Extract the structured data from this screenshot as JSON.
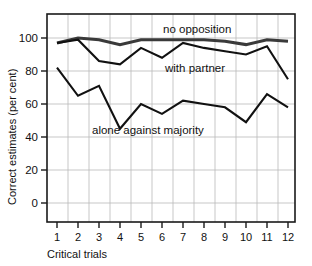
{
  "chart_data": {
    "type": "line",
    "title": "",
    "xlabel": "Critical trials",
    "ylabel": "Correct estimates (per cent)",
    "x": [
      1,
      2,
      3,
      4,
      5,
      6,
      7,
      8,
      9,
      10,
      11,
      12
    ],
    "categories": [
      "1",
      "2",
      "3",
      "4",
      "5",
      "6",
      "7",
      "8",
      "9",
      "10",
      "11",
      "12"
    ],
    "xlim": [
      0.3,
      12.6
    ],
    "ylim": [
      -10,
      112
    ],
    "yticks": [
      0,
      20,
      40,
      60,
      80,
      100
    ],
    "ytick_labels": [
      "0",
      "20",
      "40",
      "60",
      "80",
      "100"
    ],
    "grid": true,
    "legend_position": "inline-annotations",
    "series": [
      {
        "name": "no opposition",
        "color": "#3a3a3a",
        "values": [
          97,
          100,
          99,
          96,
          99,
          99,
          99,
          99,
          98,
          96,
          99,
          98
        ]
      },
      {
        "name": "with partner",
        "color": "#111111",
        "values": [
          97,
          99,
          86,
          84,
          94,
          88,
          97,
          94,
          92,
          90,
          95,
          75
        ]
      },
      {
        "name": "alone against majority",
        "color": "#111111",
        "values": [
          82,
          65,
          71,
          45,
          60,
          54,
          62,
          60,
          58,
          49,
          66,
          58
        ]
      }
    ],
    "annotations": [
      {
        "text": "no opposition",
        "x_px": 163,
        "y_px": 33
      },
      {
        "text": "with partner",
        "x_px": 165,
        "y_px": 72
      },
      {
        "text": "alone against majority",
        "x_px": 92,
        "y_px": 134
      }
    ]
  },
  "axis": {
    "x_title": "Critical trials",
    "y_title": "Correct estimates (per cent)",
    "y_labels": [
      "100",
      "80",
      "60",
      "40",
      "20",
      "0"
    ],
    "x_labels": [
      "1",
      "2",
      "3",
      "4",
      "5",
      "6",
      "7",
      "8",
      "9",
      "10",
      "11",
      "12"
    ]
  },
  "series_labels": {
    "no_opposition": "no opposition",
    "with_partner": "with partner",
    "alone_against_majority": "alone against majority"
  }
}
